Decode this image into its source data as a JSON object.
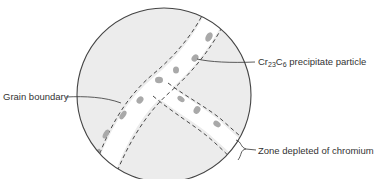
{
  "diagram": {
    "type": "schematic",
    "colors": {
      "grain_fill": "#ececec",
      "depleted_zone_fill": "#ffffff",
      "precipitate": "#a9a9a9",
      "outline": "#444444",
      "text": "#333333"
    },
    "labels": {
      "grain_boundary": "Grain boundary",
      "precipitate_prefix": "Cr",
      "precipitate_sub1": "23",
      "precipitate_mid": "C",
      "precipitate_sub2": "6",
      "precipitate_suffix": " precipitate particle",
      "zone": "Zone depleted of chromium"
    }
  }
}
